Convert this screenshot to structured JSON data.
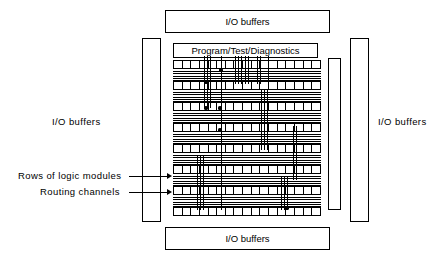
{
  "diagram": {
    "io_buffers": {
      "top_label": "I/O buffers",
      "bottom_label": "I/O buffers",
      "left_label": "I/O buffers",
      "right_label": "I/O buffers"
    },
    "program_block": {
      "label": "Program/Test/Diagnostics"
    },
    "annotations": [
      {
        "label": "Rows of logic modules"
      },
      {
        "label": "Routing channels"
      }
    ],
    "core": {
      "module_rows": 8,
      "modules_per_row": 17,
      "routing_channel_bands": 7,
      "lines_per_channel": 6
    },
    "colors": {
      "ink": "#000000",
      "paper": "#ffffff"
    }
  }
}
